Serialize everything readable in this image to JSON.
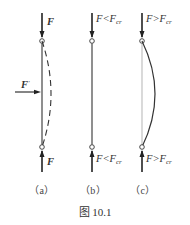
{
  "figure": {
    "caption": "图 10.1",
    "panels": [
      {
        "id": "a",
        "label": "（a）",
        "top_force": "F",
        "bottom_force": "F",
        "lateral_force": "F",
        "lateral_force_prime": "'",
        "shape": "dashed bowed deflection"
      },
      {
        "id": "b",
        "label": "（b）",
        "top_force": "F<F",
        "top_force_sub": "cr",
        "bottom_force": "F<F",
        "bottom_force_sub": "cr",
        "shape": "straight"
      },
      {
        "id": "c",
        "label": "（c）",
        "top_force": "F>F",
        "top_force_sub": "cr",
        "bottom_force": "F>F",
        "bottom_force_sub": "cr",
        "shape": "solid bowed buckled"
      }
    ],
    "colors": {
      "bar": "#333333",
      "bar_ghost": "#bbbbbb",
      "text": "#333333"
    }
  }
}
